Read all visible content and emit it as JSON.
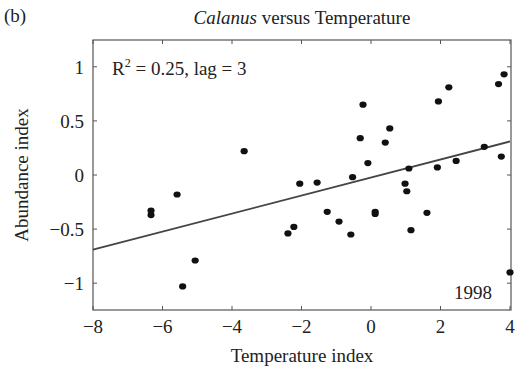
{
  "panel_label": "(b)",
  "title": {
    "italic": "Calanus",
    "rest": " versus Temperature"
  },
  "annotation": {
    "r2_prefix": "R",
    "r2_sup": "2",
    "r2_rest": " = 0.25, lag = 3",
    "year_label": "1998"
  },
  "chart_data": {
    "type": "scatter",
    "title": "Calanus versus Temperature",
    "xlabel": "Temperature index",
    "ylabel": "Abundance index",
    "xlim": [
      -8,
      4
    ],
    "ylim": [
      -1.25,
      1.25
    ],
    "xticks": [
      -8,
      -6,
      -4,
      -2,
      0,
      2,
      4
    ],
    "xtick_labels": [
      "−8",
      "−6",
      "−4",
      "−2",
      "0",
      "2",
      "4"
    ],
    "yticks": [
      1,
      0.5,
      0,
      -0.5,
      -1
    ],
    "ytick_labels": [
      "1",
      "0.5",
      "0",
      "−0.5",
      "−1"
    ],
    "grid": false,
    "legend": null,
    "annotations": [
      "R² = 0.25, lag = 3",
      "1998"
    ],
    "points": [
      {
        "x": -6.33,
        "y": -0.33
      },
      {
        "x": -6.33,
        "y": -0.37
      },
      {
        "x": -5.58,
        "y": -0.18
      },
      {
        "x": -5.42,
        "y": -1.03
      },
      {
        "x": -5.06,
        "y": -0.79
      },
      {
        "x": -3.65,
        "y": 0.22
      },
      {
        "x": -2.39,
        "y": -0.54
      },
      {
        "x": -2.22,
        "y": -0.48
      },
      {
        "x": -2.05,
        "y": -0.08
      },
      {
        "x": -1.55,
        "y": -0.07
      },
      {
        "x": -1.26,
        "y": -0.34
      },
      {
        "x": -0.92,
        "y": -0.43
      },
      {
        "x": -0.58,
        "y": -0.55
      },
      {
        "x": -0.53,
        "y": -0.02
      },
      {
        "x": -0.31,
        "y": 0.34
      },
      {
        "x": -0.23,
        "y": 0.65
      },
      {
        "x": -0.09,
        "y": 0.11
      },
      {
        "x": 0.12,
        "y": -0.34
      },
      {
        "x": 0.12,
        "y": -0.36
      },
      {
        "x": 0.41,
        "y": 0.3
      },
      {
        "x": 0.54,
        "y": 0.43
      },
      {
        "x": 0.98,
        "y": -0.08
      },
      {
        "x": 1.03,
        "y": -0.15
      },
      {
        "x": 1.09,
        "y": 0.06
      },
      {
        "x": 1.15,
        "y": -0.51
      },
      {
        "x": 1.61,
        "y": -0.35
      },
      {
        "x": 1.91,
        "y": 0.07
      },
      {
        "x": 1.94,
        "y": 0.68
      },
      {
        "x": 2.24,
        "y": 0.81
      },
      {
        "x": 2.45,
        "y": 0.13
      },
      {
        "x": 3.26,
        "y": 0.26
      },
      {
        "x": 3.67,
        "y": 0.84
      },
      {
        "x": 3.75,
        "y": 0.17
      },
      {
        "x": 3.83,
        "y": 0.93
      },
      {
        "x": 4.0,
        "y": -0.9
      }
    ],
    "regression_line": {
      "x": [
        -8,
        4
      ],
      "y": [
        -0.69,
        0.31
      ],
      "r2": 0.25,
      "lag": 3
    },
    "highlighted_point": {
      "label": "1998",
      "x": 4.0,
      "y": -0.9
    }
  },
  "style": {
    "point_color": "#111111",
    "line_color": "#444444",
    "axis_color": "#555555"
  }
}
